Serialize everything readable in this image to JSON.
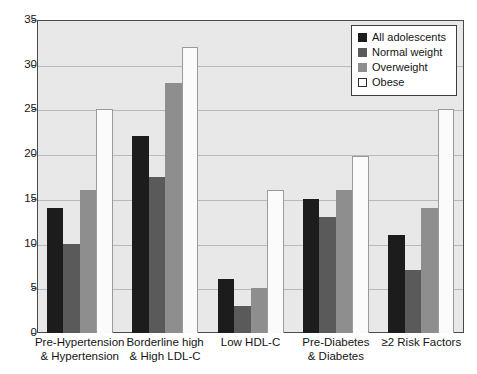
{
  "chart_data": {
    "type": "bar",
    "title": "",
    "xlabel": "",
    "ylabel": "",
    "ylim": [
      0,
      35
    ],
    "yticks": [
      0,
      5,
      10,
      15,
      20,
      25,
      30,
      35
    ],
    "ytick_labels": [
      "0",
      "5",
      "10",
      "15",
      "20",
      "25",
      "30",
      "35"
    ],
    "grid": true,
    "legend_position": "top-right",
    "categories": [
      "Pre-Hypertension & Hypertension",
      "Borderline high & High LDL-C",
      "Low HDL-C",
      "Pre-Diabetes & Diabetes",
      "≥2 Risk Factors"
    ],
    "category_lines": [
      [
        "Pre-Hypertension",
        "& Hypertension"
      ],
      [
        "Borderline high",
        "& High LDL-C"
      ],
      [
        "Low HDL-C",
        ""
      ],
      [
        "Pre-Diabetes",
        "& Diabetes"
      ],
      [
        "≥2 Risk Factors",
        ""
      ]
    ],
    "series": [
      {
        "name": "All adolescents",
        "color": "#1c1c1c",
        "values": [
          14,
          22,
          6,
          15,
          11
        ]
      },
      {
        "name": "Normal weight",
        "color": "#5a5a5a",
        "values": [
          10,
          17.5,
          3,
          13,
          7
        ]
      },
      {
        "name": "Overweight",
        "color": "#8e8e8e",
        "values": [
          16,
          28,
          5,
          16,
          14
        ]
      },
      {
        "name": "Obese",
        "color": "#ffffff",
        "values": [
          25,
          32,
          16,
          19.8,
          25
        ]
      }
    ]
  },
  "legend": {
    "items": [
      {
        "label": "All adolescents"
      },
      {
        "label": "Normal weight"
      },
      {
        "label": "Overweight"
      },
      {
        "label": "Obese"
      }
    ]
  }
}
